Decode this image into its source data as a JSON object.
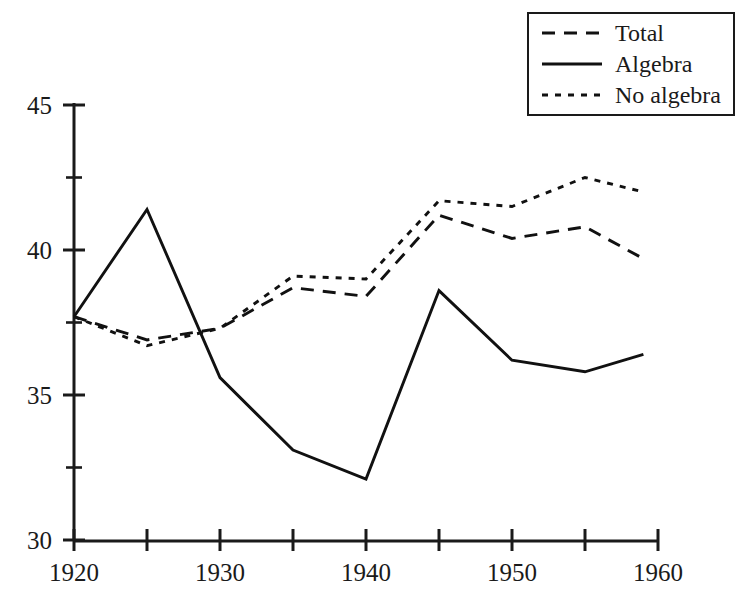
{
  "chart_data": {
    "type": "line",
    "title": "",
    "xlabel": "",
    "ylabel": "",
    "xlim": [
      1920,
      1960
    ],
    "ylim": [
      30,
      45
    ],
    "grid": false,
    "legend_position": "top-right",
    "x_ticks": [
      1920,
      1925,
      1930,
      1935,
      1940,
      1945,
      1950,
      1955,
      1960
    ],
    "x_tick_labels": [
      "1920",
      "",
      "1930",
      "",
      "1940",
      "",
      "1950",
      "",
      "1960"
    ],
    "y_ticks": [
      30,
      32.5,
      35,
      37.5,
      40,
      42.5,
      45
    ],
    "y_tick_labels": [
      "30",
      "",
      "35",
      "",
      "40",
      "",
      "45"
    ],
    "x": [
      1920,
      1925,
      1930,
      1935,
      1940,
      1945,
      1950,
      1955,
      1959
    ],
    "series": [
      {
        "name": "Total",
        "style": "dashed",
        "color": "#111111",
        "values": [
          37.7,
          36.9,
          37.3,
          38.7,
          38.4,
          41.2,
          40.4,
          40.8,
          39.7
        ]
      },
      {
        "name": "Algebra",
        "style": "solid",
        "color": "#111111",
        "values": [
          37.7,
          41.4,
          35.6,
          33.1,
          32.1,
          38.6,
          36.2,
          35.8,
          36.4
        ]
      },
      {
        "name": "No algebra",
        "style": "dotted",
        "color": "#111111",
        "values": [
          37.7,
          36.7,
          37.3,
          39.1,
          39.0,
          41.7,
          41.5,
          42.5,
          42.0
        ]
      }
    ]
  },
  "legend": {
    "items": [
      {
        "label": "Total",
        "style": "dashed"
      },
      {
        "label": "Algebra",
        "style": "solid"
      },
      {
        "label": "No algebra",
        "style": "dotted"
      }
    ]
  }
}
